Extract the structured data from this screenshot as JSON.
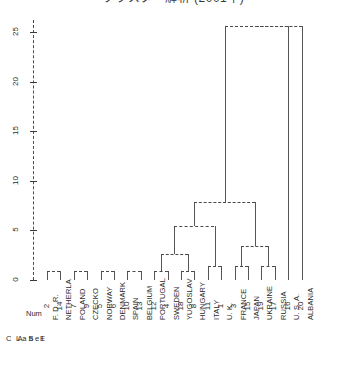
{
  "title": "クラスター解析 (2001年)",
  "axis": {
    "y_label_ticks": [
      "25",
      "20",
      "15",
      "10",
      "5",
      "0"
    ],
    "y_values": [
      25,
      20,
      15,
      10,
      5,
      0
    ],
    "ymin": 0,
    "ymax": 25
  },
  "captions": {
    "case": "C A S E",
    "label": "Label",
    "num": "Num"
  },
  "leaves": [
    {
      "num": "2",
      "label": "F. D. R."
    },
    {
      "num": "14",
      "label": "NETHERLA"
    },
    {
      "num": "7",
      "label": "POLAND"
    },
    {
      "num": "9",
      "label": "CZECKO"
    },
    {
      "num": "5",
      "label": "NORWAY"
    },
    {
      "num": "6",
      "label": "DENMARK"
    },
    {
      "num": "10",
      "label": "SPAIN"
    },
    {
      "num": "13",
      "label": "BELGIUM"
    },
    {
      "num": "12",
      "label": "PORTUGAL"
    },
    {
      "num": "4",
      "label": "SWEDEN"
    },
    {
      "num": "18",
      "label": "YUGOSLAV"
    },
    {
      "num": "8",
      "label": "HUNGARY"
    },
    {
      "num": "11",
      "label": "ITALY"
    },
    {
      "num": "1",
      "label": "U. K."
    },
    {
      "num": "3",
      "label": "FRANCE"
    },
    {
      "num": "15",
      "label": "JAPAN"
    },
    {
      "num": "19",
      "label": "UKRAINE"
    },
    {
      "num": "17",
      "label": "RUSSIA"
    },
    {
      "num": "16",
      "label": "U. S. A."
    },
    {
      "num": "20",
      "label": "ALBANIA"
    }
  ],
  "chart_data": {
    "type": "dendrogram",
    "title": "クラスター解析 (2001年)",
    "xlabel": "",
    "ylabel": "Rescaled Distance Cluster Combine",
    "ylim": [
      0,
      25
    ],
    "yticks": [
      0,
      5,
      10,
      15,
      20,
      25
    ],
    "grid": false,
    "legend": "none",
    "orientation": "vertical",
    "leaf_order": [
      "F. D. R.",
      "NETHERLA",
      "POLAND",
      "CZECKO",
      "NORWAY",
      "DENMARK",
      "SPAIN",
      "BELGIUM",
      "PORTUGAL",
      "SWEDEN",
      "YUGOSLAV",
      "HUNGARY",
      "ITALY",
      "U. K.",
      "FRANCE",
      "JAPAN",
      "UKRAINE",
      "RUSSIA",
      "U. S. A.",
      "ALBANIA"
    ],
    "leaf_nums": [
      2,
      14,
      7,
      9,
      5,
      6,
      10,
      13,
      12,
      4,
      18,
      8,
      11,
      1,
      3,
      15,
      19,
      17,
      16,
      20
    ],
    "merges": [
      {
        "id": "m1",
        "left": "F. D. R.",
        "right": "NETHERLA",
        "height": 0.9
      },
      {
        "id": "m2",
        "left": "POLAND",
        "right": "CZECKO",
        "height": 0.9
      },
      {
        "id": "m3",
        "left": "NORWAY",
        "right": "DENMARK",
        "height": 0.9
      },
      {
        "id": "m4",
        "left": "SPAIN",
        "right": "BELGIUM",
        "height": 0.9
      },
      {
        "id": "m5",
        "left": "PORTUGAL",
        "right": "SWEDEN",
        "height": 0.9
      },
      {
        "id": "m6",
        "left": "YUGOSLAV",
        "right": "HUNGARY",
        "height": 0.9
      },
      {
        "id": "m7",
        "left": "ITALY",
        "right": "U. K.",
        "height": 1.4
      },
      {
        "id": "m8",
        "left": "FRANCE",
        "right": "JAPAN",
        "height": 1.4
      },
      {
        "id": "m9",
        "left": "UKRAINE",
        "right": "RUSSIA",
        "height": 1.4
      },
      {
        "id": "m10",
        "left": "m8",
        "right": "m9",
        "height": 3.4
      },
      {
        "id": "m11",
        "left": "m5",
        "right": "m6",
        "height": 2.6
      },
      {
        "id": "m12",
        "left": "m11",
        "right": "m7",
        "height": 5.4
      },
      {
        "id": "m13",
        "left": "m12",
        "right": "m10",
        "height": 7.9
      },
      {
        "id": "m14",
        "left": "m13",
        "right": "U. S. A.",
        "height": 25.6
      },
      {
        "id": "m15",
        "left": "m14",
        "right": "ALBANIA",
        "height": 25.6
      }
    ]
  }
}
